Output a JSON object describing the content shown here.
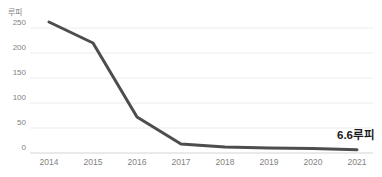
{
  "chart": {
    "unit_label": "루피",
    "annotation": "6.6루피",
    "line_color": "#4d4d4d",
    "grid_color": "#ececec",
    "axis_color": "#d4d4d4",
    "tick_color": "#828282",
    "annotation_color": "#1a1a1a"
  },
  "chart_data": {
    "type": "line",
    "title": "",
    "xlabel": "",
    "ylabel": "루피",
    "categories": [
      "2014",
      "2015",
      "2016",
      "2017",
      "2018",
      "2019",
      "2020",
      "2021"
    ],
    "values": [
      262,
      220,
      72,
      18,
      12,
      10,
      9,
      6.6
    ],
    "ylim": [
      0,
      250
    ],
    "yticks": [
      0,
      50,
      100,
      150,
      200,
      250
    ],
    "grid": true,
    "legend": "none",
    "annotations": [
      {
        "text": "6.6루피",
        "x": "2021",
        "y": 6.6
      }
    ]
  }
}
